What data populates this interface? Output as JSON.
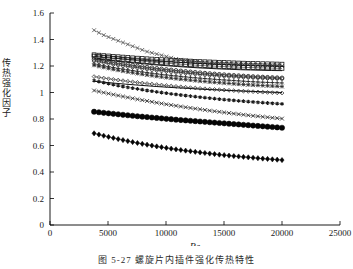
{
  "figure": {
    "caption": "图 5-27  螺旋片内插件强化传热特性",
    "y_axis_label_chars": [
      "传",
      "热",
      "强",
      "化",
      "因",
      "子"
    ]
  },
  "chart_data": {
    "type": "line",
    "title": "",
    "xlabel": "Re",
    "ylabel": "传热强化因子",
    "xlim": [
      0,
      25000
    ],
    "ylim": [
      0,
      1.6
    ],
    "xticks": [
      0,
      5000,
      10000,
      15000,
      20000,
      25000
    ],
    "xticklabels": [
      "0",
      "5000",
      "10000",
      "15000",
      "20000",
      "25000"
    ],
    "yticks": [
      0,
      0.2,
      0.4,
      0.6,
      0.8,
      1,
      1.2,
      1.4,
      1.6
    ],
    "yticklabels": [
      "0",
      "0.2",
      "0.4",
      "0.6",
      "0.8",
      "1",
      "1.2",
      "1.4",
      "1.6"
    ],
    "grid": false,
    "legend": "none",
    "x": [
      3800,
      4700,
      5600,
      6500,
      7400,
      8300,
      9200,
      10100,
      11000,
      11900,
      12800,
      13700,
      14600,
      15500,
      16400,
      17300,
      18200,
      19100,
      20000
    ],
    "series": [
      {
        "name": "series-1-top-x",
        "marker": "x",
        "filled": false,
        "color": "#555555",
        "values": [
          1.47,
          1.43,
          1.4,
          1.37,
          1.34,
          1.31,
          1.29,
          1.27,
          1.25,
          1.24,
          1.23,
          1.22,
          1.22,
          1.215,
          1.21,
          1.21,
          1.205,
          1.205,
          1.2
        ]
      },
      {
        "name": "series-2-square-open",
        "marker": "square",
        "filled": false,
        "color": "#1a1a1a",
        "values": [
          1.285,
          1.278,
          1.272,
          1.266,
          1.26,
          1.255,
          1.25,
          1.246,
          1.242,
          1.238,
          1.234,
          1.231,
          1.228,
          1.225,
          1.222,
          1.22,
          1.218,
          1.216,
          1.214
        ]
      },
      {
        "name": "series-3-square-filled",
        "marker": "square",
        "filled": true,
        "color": "#111111",
        "values": [
          1.275,
          1.266,
          1.257,
          1.249,
          1.241,
          1.234,
          1.227,
          1.221,
          1.215,
          1.21,
          1.205,
          1.201,
          1.197,
          1.194,
          1.191,
          1.188,
          1.186,
          1.184,
          1.182
        ]
      },
      {
        "name": "series-4-solid-dash",
        "marker": "none",
        "filled": false,
        "color": "#1a1a1a",
        "values": [
          1.255,
          1.246,
          1.238,
          1.23,
          1.222,
          1.215,
          1.208,
          1.202,
          1.196,
          1.191,
          1.186,
          1.182,
          1.178,
          1.175,
          1.172,
          1.17,
          1.168,
          1.166,
          1.165
        ]
      },
      {
        "name": "series-5-circle-filled",
        "marker": "circle",
        "filled": true,
        "color": "#111111",
        "values": [
          1.25,
          1.237,
          1.225,
          1.213,
          1.202,
          1.192,
          1.182,
          1.173,
          1.165,
          1.157,
          1.15,
          1.143,
          1.137,
          1.131,
          1.126,
          1.121,
          1.117,
          1.113,
          1.11
        ]
      },
      {
        "name": "series-6-hex-open",
        "marker": "hexagon",
        "filled": false,
        "color": "#333333",
        "values": [
          1.238,
          1.224,
          1.211,
          1.199,
          1.188,
          1.178,
          1.168,
          1.16,
          1.152,
          1.145,
          1.138,
          1.132,
          1.127,
          1.122,
          1.118,
          1.114,
          1.11,
          1.107,
          1.104
        ]
      },
      {
        "name": "series-7-plus",
        "marker": "plus",
        "filled": false,
        "color": "#222222",
        "values": [
          1.215,
          1.2,
          1.186,
          1.174,
          1.162,
          1.151,
          1.141,
          1.132,
          1.124,
          1.116,
          1.109,
          1.103,
          1.097,
          1.092,
          1.087,
          1.082,
          1.078,
          1.075,
          1.072
        ]
      },
      {
        "name": "series-8-star",
        "marker": "star",
        "filled": false,
        "color": "#2a2a2a",
        "values": [
          1.205,
          1.188,
          1.172,
          1.158,
          1.145,
          1.133,
          1.122,
          1.112,
          1.103,
          1.095,
          1.087,
          1.08,
          1.074,
          1.068,
          1.062,
          1.057,
          1.053,
          1.049,
          1.045
        ]
      },
      {
        "name": "series-9-diamond-open",
        "marker": "diamond",
        "filled": false,
        "color": "#333333",
        "values": [
          1.12,
          1.108,
          1.097,
          1.087,
          1.077,
          1.068,
          1.06,
          1.052,
          1.045,
          1.038,
          1.032,
          1.026,
          1.021,
          1.016,
          1.011,
          1.007,
          1.003,
          0.999,
          0.996
        ]
      },
      {
        "name": "series-10-solid-line",
        "marker": "none",
        "filled": false,
        "color": "#111111",
        "values": [
          1.085,
          1.077,
          1.07,
          1.063,
          1.057,
          1.051,
          1.045,
          1.04,
          1.035,
          1.031,
          1.026,
          1.022,
          1.019,
          1.015,
          1.012,
          1.009,
          1.006,
          1.003,
          1.0
        ]
      },
      {
        "name": "series-11-asterisk",
        "marker": "asterisk",
        "filled": true,
        "color": "#1a1a1a",
        "values": [
          1.09,
          1.073,
          1.057,
          1.042,
          1.029,
          1.016,
          1.005,
          0.994,
          0.984,
          0.975,
          0.966,
          0.958,
          0.95,
          0.943,
          0.936,
          0.93,
          0.924,
          0.919,
          0.914
        ]
      },
      {
        "name": "series-12-x-open",
        "marker": "x",
        "filled": false,
        "color": "#2b2b2b",
        "values": [
          1.015,
          0.998,
          0.982,
          0.966,
          0.951,
          0.937,
          0.923,
          0.91,
          0.898,
          0.886,
          0.875,
          0.864,
          0.854,
          0.844,
          0.835,
          0.826,
          0.818,
          0.81,
          0.803
        ]
      },
      {
        "name": "series-13-circle-big-filled",
        "marker": "circle-big",
        "filled": true,
        "color": "#050505",
        "values": [
          0.855,
          0.846,
          0.838,
          0.83,
          0.822,
          0.815,
          0.808,
          0.801,
          0.794,
          0.788,
          0.782,
          0.776,
          0.77,
          0.764,
          0.758,
          0.752,
          0.746,
          0.74,
          0.734
        ]
      },
      {
        "name": "series-14-diamond-filled",
        "marker": "diamond-filled",
        "filled": true,
        "color": "#050505",
        "values": [
          0.692,
          0.672,
          0.654,
          0.637,
          0.621,
          0.607,
          0.593,
          0.581,
          0.569,
          0.559,
          0.549,
          0.54,
          0.531,
          0.523,
          0.516,
          0.509,
          0.502,
          0.496,
          0.49
        ]
      }
    ]
  },
  "axis": {
    "x_label": "Re"
  }
}
